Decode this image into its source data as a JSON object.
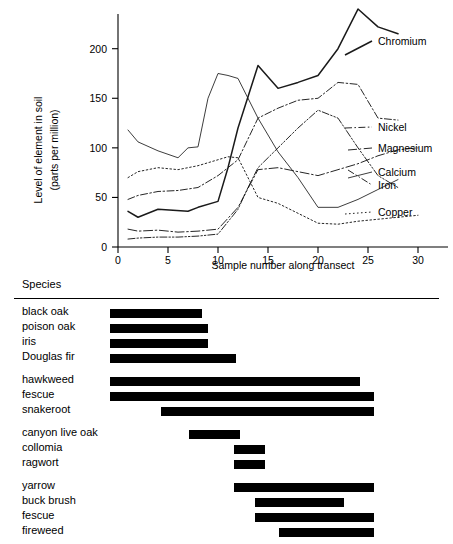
{
  "chart_data": {
    "type": "line",
    "title": "",
    "xlabel": "Sample  number along transect",
    "ylabel": "Level of element in soil (parts per million)",
    "ylabel_line1": "Level of element in soil",
    "ylabel_line2": "(parts per million)",
    "xlim": [
      0,
      33
    ],
    "ylim": [
      0,
      235
    ],
    "xticks": [
      0,
      5,
      10,
      15,
      20,
      25,
      30
    ],
    "yticks": [
      0,
      50,
      100,
      150,
      200
    ],
    "grid": false,
    "legend_position": "right-inline",
    "series": [
      {
        "name": "Chromium",
        "style": "solid-thick",
        "x": [
          1,
          2,
          4,
          7,
          8,
          10,
          11,
          12,
          14,
          16,
          18,
          20,
          22,
          24,
          26,
          28
        ],
        "values": [
          36,
          30,
          38,
          36,
          40,
          46,
          80,
          120,
          183,
          160,
          166,
          173,
          200,
          240,
          222,
          215
        ]
      },
      {
        "name": "Nickel",
        "style": "dash-dot",
        "x": [
          1,
          2,
          4,
          6,
          8,
          10,
          11,
          12,
          14,
          16,
          18,
          20,
          22,
          24,
          26,
          28
        ],
        "values": [
          48,
          52,
          56,
          57,
          60,
          72,
          80,
          88,
          130,
          140,
          148,
          150,
          166,
          164,
          130,
          128
        ]
      },
      {
        "name": "Magnesium",
        "style": "dash-dot-long",
        "x": [
          1,
          2,
          4,
          6,
          8,
          10,
          12,
          14,
          16,
          18,
          20,
          22,
          24,
          26,
          28,
          30
        ],
        "values": [
          18,
          16,
          17,
          15,
          16,
          18,
          40,
          78,
          80,
          76,
          72,
          78,
          84,
          92,
          98,
          100
        ]
      },
      {
        "name": "Calcium",
        "style": "solid-thin",
        "x": [
          1,
          2,
          4,
          6,
          7,
          8,
          9,
          10,
          11,
          12,
          14,
          16,
          18,
          20,
          22,
          24,
          26,
          28
        ],
        "values": [
          118,
          106,
          97,
          90,
          100,
          101,
          150,
          175,
          173,
          170,
          130,
          96,
          70,
          40,
          40,
          48,
          58,
          68
        ]
      },
      {
        "name": "Iron",
        "style": "dash-dot-dot",
        "x": [
          1,
          2,
          4,
          6,
          8,
          10,
          12,
          13,
          14,
          16,
          18,
          20,
          22,
          24,
          26,
          28
        ],
        "values": [
          8,
          9,
          10,
          10,
          11,
          13,
          38,
          60,
          80,
          100,
          120,
          138,
          130,
          100,
          72,
          60
        ]
      },
      {
        "name": "Copper",
        "style": "dotted",
        "x": [
          1,
          2,
          4,
          6,
          8,
          10,
          11,
          12,
          14,
          16,
          18,
          20,
          22,
          24,
          26,
          28,
          30
        ],
        "values": [
          70,
          76,
          80,
          78,
          82,
          88,
          91,
          90,
          50,
          44,
          34,
          24,
          23,
          26,
          28,
          30,
          32
        ]
      }
    ]
  },
  "species_panel": {
    "header": "Species",
    "groups": [
      {
        "rows": [
          {
            "label": "black oak",
            "start": 1,
            "end": 10.5
          },
          {
            "label": "poison oak",
            "start": 1,
            "end": 11.2
          },
          {
            "label": "iris",
            "start": 1,
            "end": 11.2
          },
          {
            "label": "Douglas fir",
            "start": 1,
            "end": 14.1
          }
        ]
      },
      {
        "rows": [
          {
            "label": "hawkweed",
            "start": 1,
            "end": 26.9
          },
          {
            "label": "fescue",
            "start": 1,
            "end": 28.4
          },
          {
            "label": "snakeroot",
            "start": 6.3,
            "end": 28.4
          }
        ]
      },
      {
        "rows": [
          {
            "label": "canyon live oak",
            "start": 9.2,
            "end": 14.5
          },
          {
            "label": "collomia",
            "start": 13.9,
            "end": 17.1
          },
          {
            "label": "ragwort",
            "start": 13.9,
            "end": 17.1
          }
        ]
      },
      {
        "rows": [
          {
            "label": "yarrow",
            "start": 13.9,
            "end": 28.4
          },
          {
            "label": "buck brush",
            "start": 16.0,
            "end": 25.3
          },
          {
            "label": "fescue",
            "start": 16.0,
            "end": 28.4
          },
          {
            "label": "fireweed",
            "start": 18.5,
            "end": 28.4
          }
        ]
      },
      {
        "rows": [
          {
            "label": "",
            "start": 21.6,
            "end": 28.4
          }
        ]
      }
    ]
  }
}
